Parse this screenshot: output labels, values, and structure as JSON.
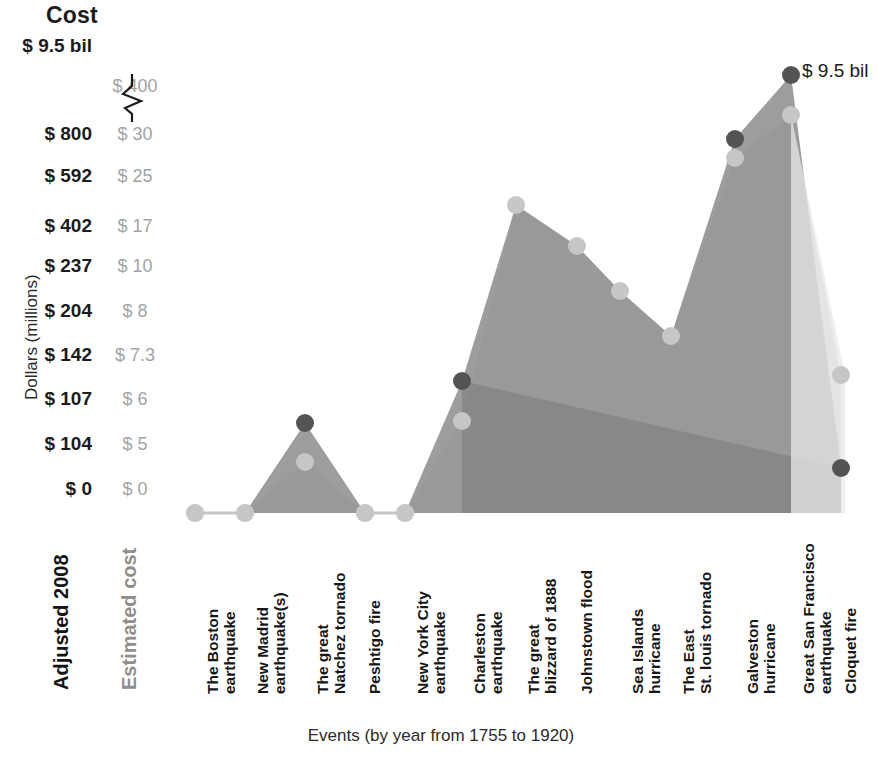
{
  "title": "Cost",
  "axes": {
    "y_caption": "Dollars (millions)",
    "x_caption": "Events (by year from 1755 to 1920)",
    "series_label_primary": "Adjusted 2008",
    "series_label_secondary": "Estimated cost"
  },
  "annotation": {
    "peak_label": "$ 9.5 bil"
  },
  "ticks": [
    {
      "y": 48,
      "adjusted": "$ 9.5 bil",
      "estimated": ""
    },
    {
      "y": 88,
      "adjusted": "",
      "estimated": "$ 400"
    },
    {
      "y": 136,
      "adjusted": "$ 800",
      "estimated": "$ 30"
    },
    {
      "y": 178,
      "adjusted": "$ 592",
      "estimated": "$ 25"
    },
    {
      "y": 228,
      "adjusted": "$ 402",
      "estimated": "$ 17"
    },
    {
      "y": 268,
      "adjusted": "$ 237",
      "estimated": "$ 10"
    },
    {
      "y": 313,
      "adjusted": "$ 204",
      "estimated": "$ 8"
    },
    {
      "y": 357,
      "adjusted": "$ 142",
      "estimated": "$ 7.3"
    },
    {
      "y": 401,
      "adjusted": "$ 107",
      "estimated": "$ 6"
    },
    {
      "y": 446,
      "adjusted": "$ 104",
      "estimated": "$ 5"
    },
    {
      "y": 491,
      "adjusted": "$ 0",
      "estimated": "$ 0"
    }
  ],
  "chart_data": {
    "type": "area",
    "title": "Cost",
    "xlabel": "Events (by year from 1755 to 1920)",
    "ylabel": "Dollars (millions)",
    "grid": false,
    "legend": "axis-labels",
    "axis_break": true,
    "yticks_adjusted": [
      "$ 0",
      "$ 104",
      "$ 107",
      "$ 142",
      "$ 204",
      "$ 237",
      "$ 402",
      "$ 592",
      "$ 800",
      "$ 9.5 bil"
    ],
    "yticks_estimated": [
      "$ 0",
      "$ 5",
      "$ 6",
      "$ 7.3",
      "$ 8",
      "$ 10",
      "$ 17",
      "$ 25",
      "$ 30",
      "$ 400"
    ],
    "categories": [
      "The Boston earthquake",
      "New Madrid earthquake(s)",
      "The great Natchez tornado",
      "Peshtigo fire",
      "New York City earthquake",
      "Charleston earthquake",
      "The great blizzard of 1888",
      "Johnstown flood",
      "Sea Islands hurricane",
      "The East St. louis tornado",
      "Galveston hurricane",
      "Great San Francisco earthquake",
      "Cloquet fire"
    ],
    "series": [
      {
        "name": "Adjusted 2008",
        "color": "#4d4d4d",
        "values": [
          0,
          0,
          107,
          0,
          0,
          142,
          592,
          402,
          237,
          204,
          800,
          9500,
          104
        ]
      },
      {
        "name": "Estimated cost",
        "color": "#b0b0b0",
        "values": [
          0,
          0,
          5,
          0,
          0,
          6,
          25,
          17,
          10,
          8,
          30,
          400,
          7.3
        ]
      }
    ]
  },
  "categories_lines": [
    [
      "The Boston",
      "earthquake"
    ],
    [
      "New Madrid",
      "earthquake(s)"
    ],
    [
      "The great",
      "Natchez tornado"
    ],
    [
      "Peshtigo fire"
    ],
    [
      "New York City",
      "earthquake"
    ],
    [
      "Charleston",
      "earthquake"
    ],
    [
      "The great",
      "blizzard of 1888"
    ],
    [
      "Johnstown flood"
    ],
    [
      "Sea Islands",
      "hurricane"
    ],
    [
      "The East",
      "St. louis tornado"
    ],
    [
      "Galveston",
      "hurricane"
    ],
    [
      "Great San Francisco",
      "earthquake"
    ],
    [
      "Cloquet fire"
    ]
  ],
  "colors": {
    "fill_dark": "#8f8f8f",
    "fill_mid": "#a8a8a8",
    "fill_light": "#d8d8d8",
    "fill_lighter": "#e8e8e8",
    "marker_dark": "#545454",
    "marker_light": "#c6c6c6",
    "text": "#1b1b1b",
    "text_muted": "#a3a3a3"
  },
  "geometry": {
    "x": [
      195,
      245,
      305,
      365,
      405,
      462,
      516,
      577,
      620,
      671,
      735,
      791,
      841
    ],
    "baseline_y": 513,
    "adjusted_y": [
      513,
      513,
      423,
      513,
      513,
      381,
      205,
      246,
      291,
      336,
      139,
      75,
      468
    ],
    "estimated_y": [
      513,
      513,
      462,
      513,
      513,
      421,
      205,
      246,
      291,
      336,
      158,
      115,
      375
    ]
  }
}
